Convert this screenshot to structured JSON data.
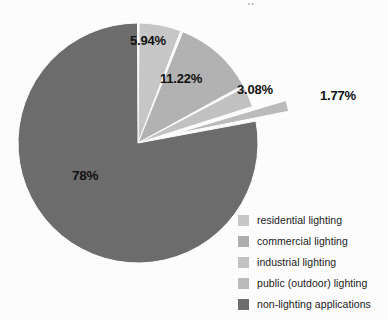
{
  "figure": {
    "title_remnant": "y",
    "background": "#ffffff"
  },
  "chart_data": {
    "type": "pie",
    "title": "",
    "xlabel": "",
    "ylabel": "",
    "grid": false,
    "legend_position": "bottom-right",
    "start_angle_deg": 0,
    "direction": "clockwise",
    "units": "percent",
    "categories": [
      "residential lighting",
      "commercial lighting",
      "industrial lighting",
      "public (outdoor) lighting",
      "non-lighting applications"
    ],
    "values": [
      5.94,
      11.22,
      3.08,
      1.77,
      78
    ],
    "labels": [
      "5.94%",
      "11.22%",
      "3.08%",
      "1.77%",
      "78%"
    ],
    "colors": [
      "#c9c9c9",
      "#b4b4b4",
      "#c4c4c4",
      "#bdbdbd",
      "#6e6e6e"
    ],
    "exploded": [
      false,
      false,
      false,
      true,
      false
    ],
    "slices": [
      {
        "name": "residential lighting",
        "value": 5.94,
        "label": "5.94%",
        "color": "#c9c9c9",
        "exploded": false
      },
      {
        "name": "commercial lighting",
        "value": 11.22,
        "label": "11.22%",
        "color": "#b4b4b4",
        "exploded": false
      },
      {
        "name": "industrial lighting",
        "value": 3.08,
        "label": "3.08%",
        "color": "#c4c4c4",
        "exploded": false
      },
      {
        "name": "public (outdoor) lighting",
        "value": 1.77,
        "label": "1.77%",
        "color": "#bdbdbd",
        "exploded": true
      },
      {
        "name": "non-lighting applications",
        "value": 78,
        "label": "78%",
        "color": "#6e6e6e",
        "exploded": false
      }
    ]
  },
  "legend": {
    "items": [
      {
        "label": "residential lighting",
        "color": "#c9c9c9"
      },
      {
        "label": "commercial lighting",
        "color": "#b0b0b0"
      },
      {
        "label": "industrial lighting",
        "color": "#c4c4c4"
      },
      {
        "label": "public (outdoor) lighting",
        "color": "#bdbdbd"
      },
      {
        "label": "non-lighting applications",
        "color": "#6e6e6e"
      }
    ]
  }
}
